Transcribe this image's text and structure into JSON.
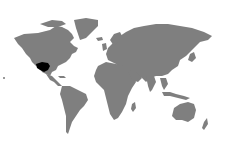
{
  "map": {
    "title": "World locator map",
    "projection": "Robinson-like world",
    "land_color": "#7f7f7f",
    "ocean_color": "#ffffff",
    "highlight_color": "#000000",
    "highlight_region": "Southwestern United States",
    "marker": {
      "x": 4,
      "y": 78,
      "description": "small mark at left edge"
    }
  }
}
